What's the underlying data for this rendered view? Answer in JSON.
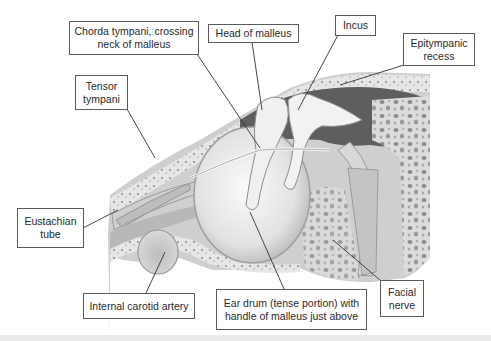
{
  "diagram": {
    "labels": [
      {
        "id": "chorda-tympani",
        "text": "Chorda tympani, crossing\nneck of malleus"
      },
      {
        "id": "head-of-malleus",
        "text": "Head of malleus"
      },
      {
        "id": "incus",
        "text": "Incus"
      },
      {
        "id": "epitympanic-recess",
        "text": "Epitympanic\nrecess"
      },
      {
        "id": "tensor-tympani",
        "text": "Tensor\ntympani"
      },
      {
        "id": "eustachian-tube",
        "text": "Eustachian\ntube"
      },
      {
        "id": "internal-carotid-artery",
        "text": "Internal carotid artery"
      },
      {
        "id": "ear-drum",
        "text": "Ear drum (tense portion) with\nhandle of malleus just above"
      },
      {
        "id": "facial-nerve",
        "text": "Facial\nnerve"
      }
    ]
  },
  "colors": {
    "background": "#ffffff",
    "bone": "#e4e4e4",
    "cavity_dark": "#5c5c5c",
    "tissue": "#c8c8c8",
    "leader_line": "#333333",
    "box_border": "#5a5a5a"
  }
}
